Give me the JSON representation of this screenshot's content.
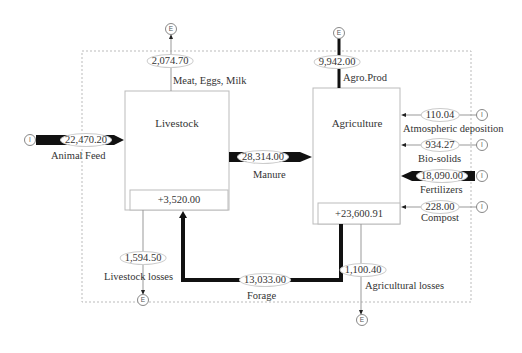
{
  "diagram": {
    "boxes": {
      "livestock": {
        "label": "Livestock",
        "stock_change": "+3,520.00"
      },
      "agriculture": {
        "label": "Agriculture",
        "stock_change": "+23,600.91"
      }
    },
    "flows": [
      {
        "id": "animal_feed",
        "from": "I",
        "to": "Livestock",
        "value": "22,470.20",
        "label": "Animal Feed",
        "weight": "heavy"
      },
      {
        "id": "meat_eggs_milk",
        "from": "Livestock",
        "to": "E",
        "value": "2,074.70",
        "label": "Meat, Eggs, Milk",
        "weight": "thin"
      },
      {
        "id": "manure",
        "from": "Livestock",
        "to": "Agriculture",
        "value": "28,314.00",
        "label": "Manure",
        "weight": "heavy"
      },
      {
        "id": "livestock_losses",
        "from": "Livestock",
        "to": "E",
        "value": "1,594.50",
        "label": "Livestock losses",
        "weight": "thin"
      },
      {
        "id": "forage",
        "from": "Agriculture",
        "to": "Livestock",
        "value": "13,033.00",
        "label": "Forage",
        "weight": "heavy"
      },
      {
        "id": "agro_prod",
        "from": "Agriculture",
        "to": "E",
        "value": "9,942.00",
        "label": "Agro.Prod",
        "weight": "medium"
      },
      {
        "id": "atmospheric_deposition",
        "from": "I",
        "to": "Agriculture",
        "value": "110.04",
        "label": "Atmospheric deposition",
        "weight": "thin"
      },
      {
        "id": "bio_solids",
        "from": "I",
        "to": "Agriculture",
        "value": "934.27",
        "label": "Bio-solids",
        "weight": "thin"
      },
      {
        "id": "fertilizers",
        "from": "I",
        "to": "Agriculture",
        "value": "18,090.00",
        "label": "Fertilizers",
        "weight": "heavy"
      },
      {
        "id": "compost",
        "from": "I",
        "to": "Agriculture",
        "value": "228.00",
        "label": "Compost",
        "weight": "thin"
      },
      {
        "id": "agricultural_losses",
        "from": "Agriculture",
        "to": "E",
        "value": "1,100.40",
        "label": "Agricultural losses",
        "weight": "thin"
      }
    ],
    "nodes": {
      "import": "I",
      "export": "E"
    }
  }
}
